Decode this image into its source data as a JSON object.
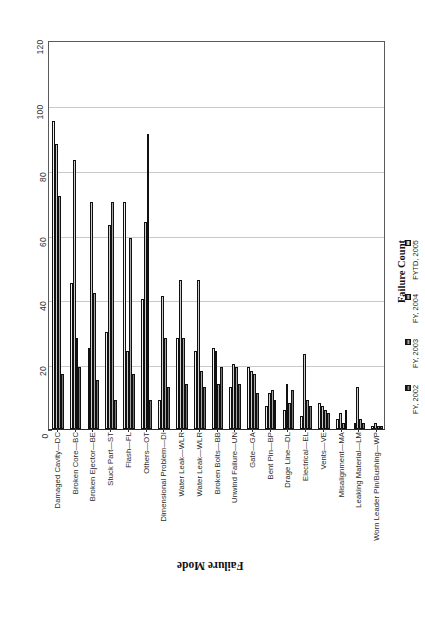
{
  "chart_data": {
    "type": "bar",
    "title": "",
    "xlabel": "Failure Mode",
    "ylabel": "Failure Count",
    "ylim": [
      0,
      120
    ],
    "yticks": [
      0,
      20,
      40,
      60,
      80,
      100,
      120
    ],
    "grid": true,
    "legend_position": "right",
    "legend_title": "Failure Count",
    "categories": [
      "Damaged Cavity—DC",
      "Broken Core—BC",
      "Broken Ejector—BE",
      "Stuck Part—ST",
      "Flash—FL",
      "Others—OT",
      "Dimensional Problem—DI",
      "Water Leak—WLR",
      "Water Leak—WLR",
      "Broken Bolts—BB",
      "Unwind Failure—UN",
      "Gate—GA",
      "Bent Pin—BP",
      "Drage Line—DL",
      "Electrical—EL",
      "Vents—VE",
      "Misalignment—MA",
      "Leaking Material—LM",
      "Worn Leader Pin/Bushing—WP"
    ],
    "series": [
      {
        "name": "FYTD, 2005",
        "values": [
          95,
          45,
          25,
          30,
          70,
          40,
          9,
          28,
          24,
          25,
          13,
          19,
          7,
          6,
          4,
          8,
          3,
          2,
          1
        ]
      },
      {
        "name": "FY, 2004",
        "values": [
          88,
          83,
          70,
          63,
          24,
          64,
          41,
          46,
          46,
          24,
          20,
          18,
          11,
          14,
          23,
          7,
          5,
          13,
          2
        ]
      },
      {
        "name": "FY, 2003",
        "values": [
          72,
          28,
          42,
          70,
          59,
          91,
          28,
          28,
          18,
          14,
          19,
          17,
          12,
          8,
          9,
          6,
          2,
          3,
          1
        ]
      },
      {
        "name": "FY, 2002",
        "values": [
          17,
          19,
          15,
          9,
          17,
          9,
          13,
          14,
          13,
          19,
          14,
          11,
          9,
          12,
          7,
          5,
          6,
          2,
          1
        ]
      }
    ]
  },
  "legend": {
    "title": "Failure Count",
    "entries": [
      {
        "label": "FYTD, 2005"
      },
      {
        "label": "FY, 2004"
      },
      {
        "label": "FY, 2003"
      },
      {
        "label": "FY, 2002"
      }
    ]
  },
  "axes": {
    "x_title": "Failure Mode",
    "y_title": "Failure Count"
  },
  "colors": {
    "axis": "#2b2b2b",
    "grid": "#c9c9c9",
    "bar_dark": "#111111",
    "bar_light": "#f4f4f4",
    "background": "#ffffff"
  }
}
